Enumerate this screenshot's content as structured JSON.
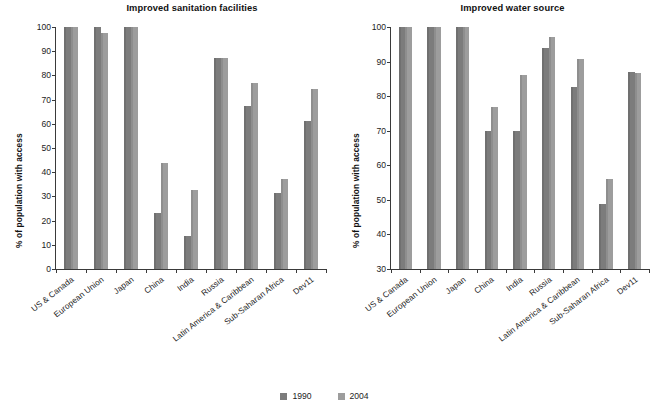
{
  "legend": {
    "position": "bottom-center",
    "entries": [
      {
        "label": "1990",
        "color": "#7c7c7c",
        "swatch_name": "legend-swatch-1990"
      },
      {
        "label": "2004",
        "color": "#9d9d9d",
        "swatch_name": "legend-swatch-2004"
      }
    ]
  },
  "chart_data": [
    {
      "type": "bar",
      "panel": "left",
      "title": "Improved sanitation facilities",
      "xlabel": "",
      "ylabel": "% of population with access",
      "ylim": [
        0,
        100
      ],
      "ytick_step": 10,
      "yticks": [
        0,
        10,
        20,
        30,
        40,
        50,
        60,
        70,
        80,
        90,
        100
      ],
      "grid": false,
      "categories": [
        "US & Canada",
        "European Union",
        "Japan",
        "China",
        "India",
        "Russia",
        "Latin America & Caribbean",
        "Sub-Saharan Africa",
        "Dev11"
      ],
      "series": [
        {
          "name": "1990",
          "color": "#7c7c7c",
          "values": [
            100,
            100,
            100,
            23,
            13.8,
            87,
            67.3,
            31.3,
            61
          ]
        },
        {
          "name": "2004",
          "color": "#9d9d9d",
          "values": [
            100,
            97.5,
            100,
            43.8,
            32.7,
            87,
            77,
            37,
            74.2
          ]
        }
      ]
    },
    {
      "type": "bar",
      "panel": "right",
      "title": "Improved water source",
      "xlabel": "",
      "ylabel": "% of population with access",
      "ylim": [
        30,
        100
      ],
      "ytick_step": 10,
      "yticks": [
        30,
        40,
        50,
        60,
        70,
        80,
        90,
        100
      ],
      "grid": false,
      "categories": [
        "US & Canada",
        "European Union",
        "Japan",
        "China",
        "India",
        "Russia",
        "Latin America & Caribbean",
        "Sub-Saharan Africa",
        "Dev11"
      ],
      "series": [
        {
          "name": "1990",
          "color": "#7c7c7c",
          "values": [
            100,
            100,
            100,
            69.8,
            69.8,
            93.9,
            82.7,
            48.7,
            87
          ]
        },
        {
          "name": "2004",
          "color": "#9d9d9d",
          "values": [
            100,
            100,
            100,
            77,
            86,
            97,
            90.7,
            56,
            86.6
          ]
        }
      ]
    }
  ]
}
